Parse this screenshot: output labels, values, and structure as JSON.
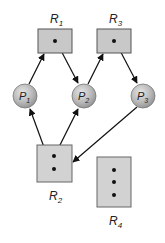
{
  "diagram": {
    "colors": {
      "box_fill": "#c8c8c8",
      "box_stroke": "#555555",
      "circle_fill": "#bdbdbd",
      "edge": "#111111",
      "text": "#222222"
    },
    "resources": [
      {
        "id": "R1",
        "name": "R",
        "sub": "1",
        "instances": 1
      },
      {
        "id": "R2",
        "name": "R",
        "sub": "2",
        "instances": 2
      },
      {
        "id": "R3",
        "name": "R",
        "sub": "3",
        "instances": 1
      },
      {
        "id": "R4",
        "name": "R",
        "sub": "4",
        "instances": 3
      }
    ],
    "processes": [
      {
        "id": "P1",
        "name": "P",
        "sub": "1"
      },
      {
        "id": "P2",
        "name": "P",
        "sub": "2"
      },
      {
        "id": "P3",
        "name": "P",
        "sub": "3"
      }
    ],
    "edges": [
      {
        "from": "P1",
        "to": "R1",
        "type": "request"
      },
      {
        "from": "R1",
        "to": "P2",
        "type": "assignment"
      },
      {
        "from": "P2",
        "to": "R3",
        "type": "request"
      },
      {
        "from": "R3",
        "to": "P3",
        "type": "assignment"
      },
      {
        "from": "R2",
        "to": "P1",
        "type": "assignment"
      },
      {
        "from": "R2",
        "to": "P2",
        "type": "assignment"
      },
      {
        "from": "P3",
        "to": "R2",
        "type": "request"
      }
    ]
  }
}
